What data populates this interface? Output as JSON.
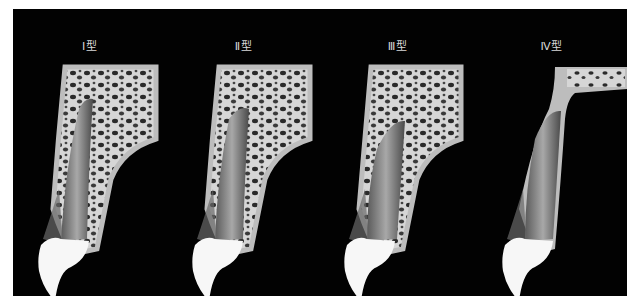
{
  "figure": {
    "background": "#020202",
    "panels": [
      {
        "label": "Ⅰ型",
        "type_numeral": "Ⅰ",
        "bone_pattern": "dense trabecular, root against labial plate"
      },
      {
        "label": "Ⅱ型",
        "type_numeral": "Ⅱ",
        "bone_pattern": "trabecular bone around root, root centered"
      },
      {
        "label": "Ⅲ型",
        "type_numeral": "Ⅲ",
        "bone_pattern": "trabecular bone, thin labial bone"
      },
      {
        "label": "Ⅳ型",
        "type_numeral": "Ⅳ",
        "bone_pattern": "minimal trabecular bone, thin bone walls"
      }
    ],
    "colors": {
      "crown": "#f7f7f7",
      "root": "#8a8a8a",
      "cortical_bone": "#bdbdbd",
      "trabecular_bone": "#d6d6d6",
      "marrow_spaces": "#2a2a2a",
      "gingiva": "#7a7a7a"
    }
  }
}
